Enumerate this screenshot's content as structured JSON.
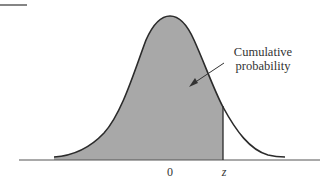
{
  "figure": {
    "type": "normal-distribution-cumulative-area",
    "annotation": {
      "line1": "Cumulative",
      "line2": "probability"
    },
    "axis_labels": {
      "mean": "0",
      "z": "z"
    },
    "colors": {
      "shaded_area": "#a8a8a8",
      "curve": "#2b2b2b",
      "axis": "#555555",
      "text": "#333333"
    }
  }
}
